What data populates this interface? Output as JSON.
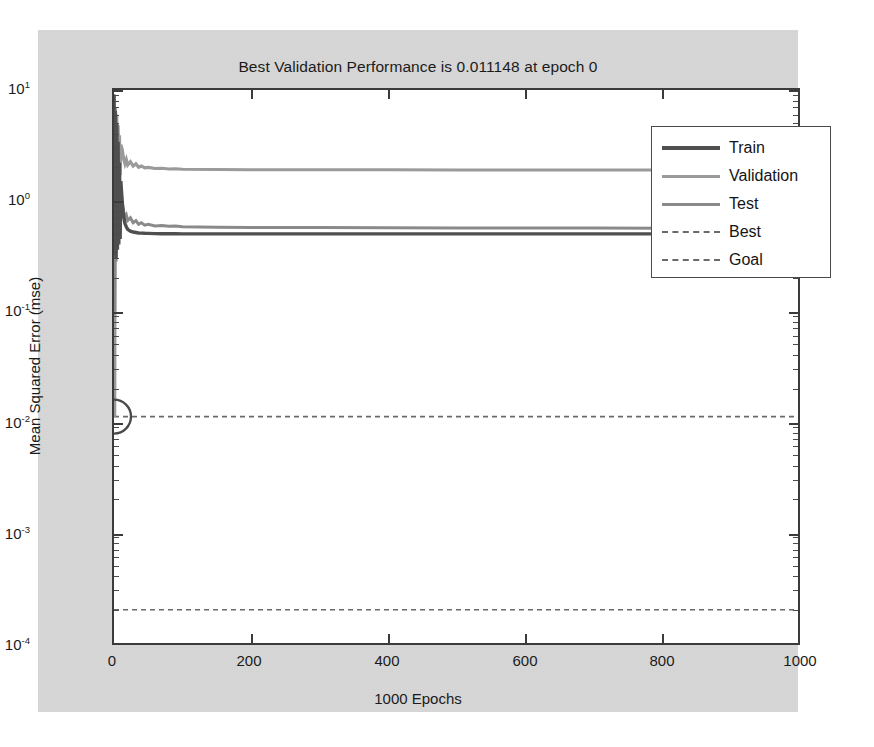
{
  "figure": {
    "title": "Best Validation Performance is 0.011148 at epoch 0",
    "xlabel": "1000 Epochs",
    "ylabel": "Mean Squared Error (mse)",
    "background_color": "#d8d8d8",
    "axes_background_color": "#ffffff"
  },
  "legend": {
    "items": [
      {
        "label": "Train",
        "style": "solid",
        "color": "#4f4f4f"
      },
      {
        "label": "Validation",
        "style": "solid",
        "color": "#9a9a9a"
      },
      {
        "label": "Test",
        "style": "solid",
        "color": "#8a8a8a"
      },
      {
        "label": "Best",
        "style": "dashed",
        "color": "#6a6a6a"
      },
      {
        "label": "Goal",
        "style": "dashed",
        "color": "#6a6a6a"
      }
    ]
  },
  "axis": {
    "y_tick_labels": [
      "10",
      "10",
      "10",
      "10",
      "10",
      "10"
    ],
    "y_tick_exponents": [
      "1",
      "0",
      "-1",
      "-2",
      "-3",
      "-4"
    ],
    "x_tick_labels": [
      "0",
      "200",
      "400",
      "600",
      "800",
      "1000"
    ]
  },
  "chart_data": {
    "type": "line",
    "title": "Best Validation Performance is 0.011148 at epoch 0",
    "xlabel": "1000 Epochs",
    "ylabel": "Mean Squared Error (mse)",
    "yscale": "log",
    "xlim": [
      0,
      1000
    ],
    "ylim": [
      0.0001,
      10
    ],
    "grid": false,
    "legend_position": "upper right",
    "best_validation_performance": 0.011148,
    "best_epoch": 0,
    "goal_value": 0.0002,
    "best_marker": {
      "x": 0,
      "y": 0.011148,
      "shape": "circle"
    },
    "annotations": [
      {
        "name": "Best",
        "type": "hline",
        "value": 0.011148,
        "style": "dashed"
      },
      {
        "name": "Goal",
        "type": "hline",
        "value": 0.0002,
        "style": "dashed"
      }
    ],
    "x": [
      0,
      1,
      2,
      3,
      4,
      5,
      6,
      7,
      8,
      9,
      10,
      12,
      14,
      16,
      18,
      20,
      24,
      28,
      32,
      36,
      40,
      45,
      50,
      60,
      70,
      80,
      90,
      100,
      150,
      200,
      300,
      400,
      500,
      600,
      700,
      800,
      900,
      1000
    ],
    "series": [
      {
        "name": "Train",
        "color": "#4f4f4f",
        "style": "solid",
        "values": [
          9.0,
          0.32,
          6.5,
          0.3,
          5.0,
          0.36,
          3.4,
          0.4,
          2.2,
          0.45,
          1.5,
          0.98,
          0.72,
          0.62,
          0.58,
          0.55,
          0.53,
          0.52,
          0.515,
          0.51,
          0.508,
          0.506,
          0.505,
          0.503,
          0.502,
          0.501,
          0.501,
          0.5,
          0.5,
          0.5,
          0.5,
          0.5,
          0.5,
          0.5,
          0.5,
          0.5,
          0.5,
          0.5
        ]
      },
      {
        "name": "Validation",
        "color": "#9a9a9a",
        "style": "solid",
        "values": [
          8.8,
          0.0111,
          7.0,
          0.9,
          6.0,
          1.2,
          4.8,
          1.5,
          3.9,
          1.7,
          3.2,
          2.9,
          2.4,
          2.15,
          2.35,
          2.1,
          2.25,
          2.05,
          2.15,
          2.0,
          2.05,
          1.98,
          2.0,
          1.95,
          1.96,
          1.93,
          1.94,
          1.92,
          1.91,
          1.9,
          1.9,
          1.9,
          1.89,
          1.89,
          1.89,
          1.89,
          1.89,
          1.89
        ]
      },
      {
        "name": "Test",
        "color": "#8a8a8a",
        "style": "solid",
        "values": [
          9.2,
          0.1,
          6.2,
          0.28,
          4.6,
          0.42,
          3.2,
          0.5,
          2.0,
          0.58,
          1.35,
          0.95,
          0.8,
          0.7,
          0.74,
          0.66,
          0.7,
          0.63,
          0.66,
          0.61,
          0.63,
          0.6,
          0.61,
          0.59,
          0.595,
          0.585,
          0.59,
          0.58,
          0.575,
          0.572,
          0.57,
          0.568,
          0.566,
          0.565,
          0.564,
          0.563,
          0.562,
          0.56
        ]
      }
    ]
  }
}
